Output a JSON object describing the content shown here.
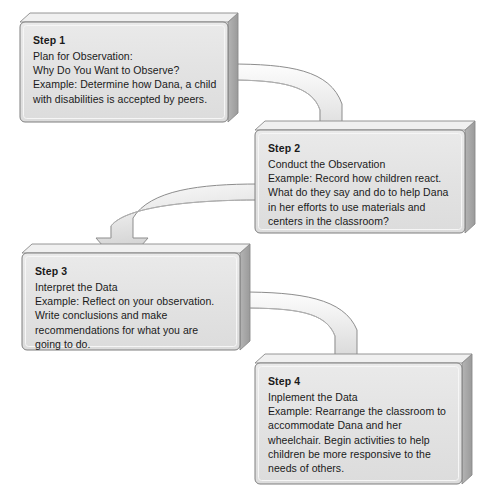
{
  "diagram": {
    "type": "flowchart",
    "orientation": "serpentine",
    "colors": {
      "box_fill": "#e2e2e2",
      "box_fill_light": "#ebebeb",
      "box_edge": "#8a8a8a",
      "box_side_shadow": "#a8a8a8",
      "box_top_bevel": "#f2f2f2",
      "arrow_fill": "#e8e8e8",
      "arrow_edge": "#8d8d8d",
      "text": "#1a1a1a",
      "background": "#ffffff"
    },
    "steps": [
      {
        "id": "step-1",
        "title": "Step 1",
        "lines": [
          "Plan for Observation:",
          "Why Do You Want to Observe?"
        ],
        "example": "Example: Determine how Dana, a child with disabilities is accepted by peers."
      },
      {
        "id": "step-2",
        "title": "Step 2",
        "lines": [
          "Conduct the Observation"
        ],
        "example": "Example: Record how children react. What do they say and do to help Dana in her efforts to use materials and centers in the classroom?"
      },
      {
        "id": "step-3",
        "title": "Step 3",
        "lines": [
          "Interpret the Data"
        ],
        "example": "Example: Reflect on your observation. Write conclusions and make recommendations for what you are going to do."
      },
      {
        "id": "step-4",
        "title": "Step 4",
        "lines": [
          "Inplement the Data"
        ],
        "example": "Example: Rearrange the classroom to accommodate Dana and her wheelchair. Begin activities to help children be more responsive to the needs of others."
      }
    ],
    "connectors": [
      {
        "id": "arrow-1-to-2",
        "from": "step-1",
        "to": "step-2",
        "direction": "right-then-down"
      },
      {
        "id": "arrow-2-to-3",
        "from": "step-2",
        "to": "step-3",
        "direction": "left-then-down"
      },
      {
        "id": "arrow-3-to-4",
        "from": "step-3",
        "to": "step-4",
        "direction": "right-then-down"
      }
    ]
  }
}
